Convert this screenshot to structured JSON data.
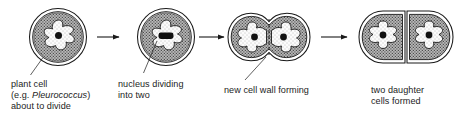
{
  "diagram": {
    "colors": {
      "outline": "#1a1a1a",
      "cytoplasm_fill": "#b6b6b6",
      "stipple_dot": "#4a4a4a",
      "wall_fill": "#ffffff",
      "vacuole_fill": "#fbfbfb",
      "nucleus_fill": "#111111",
      "text": "#1d1d1d",
      "background": "#ffffff"
    },
    "stages": [
      {
        "id": "stage-1",
        "order": 1,
        "name": "plant cell about to divide",
        "label_lines": [
          "plant cell",
          "(e.g. Pleurococcus)",
          "about to divide"
        ],
        "label_line1": "plant cell",
        "label_line2_prefix": "(e.g. ",
        "label_line2_italic": "Pleurococcus",
        "label_line2_suffix": ")",
        "label_line3": "about to divide",
        "nucleus_state": "single round nucleus",
        "nucleus_count": 1,
        "cell_shape": "single circular cell"
      },
      {
        "id": "stage-2",
        "order": 2,
        "name": "nucleus dividing into two",
        "label_lines": [
          "nucleus dividing",
          "into two"
        ],
        "label_line1": "nucleus dividing",
        "label_line2": "into two",
        "nucleus_state": "elongated dividing nucleus",
        "nucleus_count": 1,
        "cell_shape": "single circular cell"
      },
      {
        "id": "stage-3",
        "order": 3,
        "name": "new cell wall forming",
        "label_lines": [
          "new cell wall forming"
        ],
        "label_line1": "new cell wall forming",
        "nucleus_state": "two separate nuclei",
        "nucleus_count": 2,
        "cell_shape": "pinched cell with dashed new wall"
      },
      {
        "id": "stage-4",
        "order": 4,
        "name": "two daughter cells formed",
        "label_lines": [
          "two daughter",
          "cells formed"
        ],
        "label_line1": "two daughter",
        "label_line2": "cells formed",
        "nucleus_state": "one nucleus per daughter cell",
        "nucleus_count": 2,
        "cell_shape": "two adjoined daughter cells"
      }
    ],
    "arrows": [
      {
        "id": "arrow-1",
        "from": "stage-1",
        "to": "stage-2",
        "direction": "right"
      },
      {
        "id": "arrow-2",
        "from": "stage-2",
        "to": "stage-3",
        "direction": "right"
      },
      {
        "id": "arrow-3",
        "from": "stage-3",
        "to": "stage-4",
        "direction": "right"
      }
    ],
    "leader_lines": [
      {
        "id": "leader-1",
        "target": "cell wall of stage 1"
      },
      {
        "id": "leader-2",
        "target": "dividing nucleus of stage 2"
      },
      {
        "id": "leader-3",
        "target": "new cell wall of stage 3"
      }
    ]
  }
}
